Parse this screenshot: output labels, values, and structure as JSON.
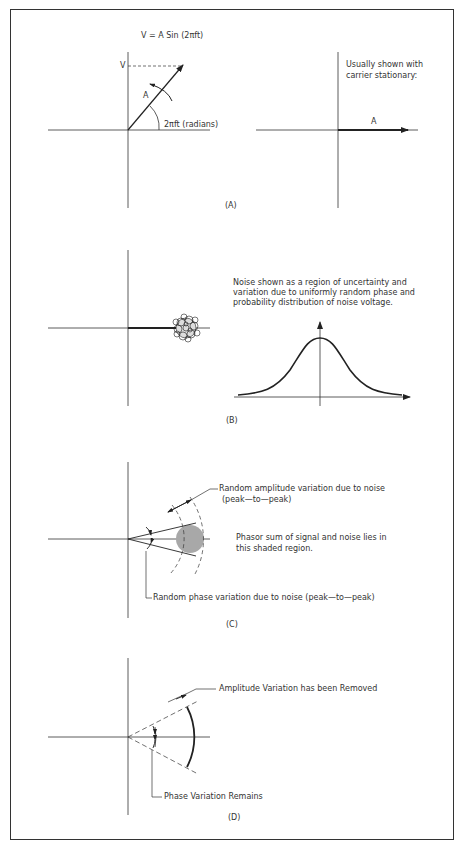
{
  "figure": {
    "panels": [
      {
        "id": "A",
        "label": "(A)",
        "equation": "V = A Sin (2πft)",
        "v_label": "V",
        "amplitude_label": "A",
        "angle_label": "2πft (radians)",
        "right_note_line1": "Usually shown with",
        "right_note_line2": "carrier stationary:",
        "right_amplitude_label": "A"
      },
      {
        "id": "B",
        "label": "(B)",
        "note_line1": "Noise shown as a region of uncertainty and",
        "note_line2": "variation due to uniformly random phase and",
        "note_line3": "probability distribution of noise voltage."
      },
      {
        "id": "C",
        "label": "(C)",
        "amplitude_note_line1": "Random amplitude variation due to noise",
        "amplitude_note_line2": "(peak—to—peak)",
        "shaded_note_line1": "Phasor sum of signal and noise lies in",
        "shaded_note_line2": "this shaded region.",
        "phase_note": "Random phase variation due to noise (peak—to—peak)"
      },
      {
        "id": "D",
        "label": "(D)",
        "amplitude_note": "Amplitude Variation has been Removed",
        "phase_note": "Phase Variation Remains"
      }
    ],
    "colors": {
      "line": "#222222",
      "shade": "#a8a8a8",
      "frame": "#333333"
    }
  }
}
